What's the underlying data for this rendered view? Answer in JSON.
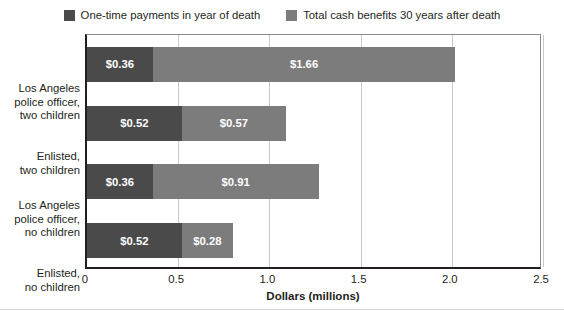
{
  "chart_data": {
    "type": "bar",
    "orientation": "horizontal",
    "stacked": true,
    "title": "",
    "xlabel": "Dollars (millions)",
    "ylabel": "",
    "xlim": [
      0,
      2.5
    ],
    "xticks": [
      "0",
      "0.5",
      "1.0",
      "1.5",
      "2.0",
      "2.5"
    ],
    "xtick_values": [
      0,
      0.5,
      1.0,
      1.5,
      2.0,
      2.5
    ],
    "grid": "vertical",
    "legend_position": "top-center",
    "categories": [
      "Los Angeles police officer, two children",
      "Enlisted, two children",
      "Los Angeles police officer, no children",
      "Enlisted, no children"
    ],
    "category_lines": [
      [
        "Los Angeles",
        "police officer,",
        "two children"
      ],
      [
        "Enlisted,",
        "two children"
      ],
      [
        "Los Angeles",
        "police officer,",
        "no children"
      ],
      [
        "Enlisted,",
        "no children"
      ]
    ],
    "series": [
      {
        "name": "One-time payments in year of death",
        "color": "#4a4a4a",
        "values": [
          0.36,
          0.52,
          0.36,
          0.52
        ],
        "labels": [
          "$0.36",
          "$0.52",
          "$0.36",
          "$0.52"
        ]
      },
      {
        "name": "Total cash benefits 30 years after death",
        "color": "#7c7c7c",
        "values": [
          1.66,
          0.57,
          0.91,
          0.28
        ],
        "labels": [
          "$1.66",
          "$0.57",
          "$0.91",
          "$0.28"
        ]
      }
    ],
    "totals": [
      2.02,
      1.09,
      1.27,
      0.8
    ]
  },
  "legend": {
    "items": [
      {
        "label": "One-time payments in year of death",
        "color": "#4a4a4a"
      },
      {
        "label": "Total cash benefits 30 years after death",
        "color": "#7c7c7c"
      }
    ]
  },
  "colors": {
    "series_one_time": "#4a4a4a",
    "series_total": "#7c7c7c",
    "axis": "#231f20",
    "gridline": "#c9c9c9",
    "background": "#ffffff",
    "bar_label_text": "#ffffff"
  }
}
